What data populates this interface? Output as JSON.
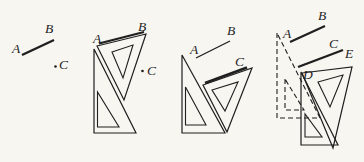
{
  "figure": {
    "background": "#f7f6f1",
    "ink": "#1f1f1f",
    "canvas": {
      "width": 364,
      "height": 162
    },
    "panels": [
      {
        "id": "step-1-given-line-and-point",
        "shapes": [
          {
            "kind": "line",
            "name": "segment-AB",
            "x1": 22,
            "y1": 55,
            "x2": 54,
            "y2": 40,
            "width": 2.4
          },
          {
            "kind": "dot",
            "name": "point-C-dot",
            "cx": 55.5,
            "cy": 66.5,
            "r": 1.3
          }
        ],
        "labels": [
          {
            "name": "label-A",
            "text": "A",
            "x": 12,
            "y": 53
          },
          {
            "name": "label-B",
            "text": "B",
            "x": 45,
            "y": 33
          },
          {
            "name": "label-C",
            "text": "C",
            "x": 59,
            "y": 69
          }
        ]
      },
      {
        "id": "step-2-set-square-edge-on-AB",
        "shapes": [
          {
            "kind": "polygon",
            "name": "fixed-square-outline",
            "points": "94,49 94,133 136,133",
            "width": 1.2
          },
          {
            "kind": "polygon",
            "name": "fixed-square-hole",
            "points": "97.5,92 97.5,127 119,127",
            "width": 1.1
          },
          {
            "kind": "polygon",
            "name": "sliding-square-outline",
            "points": "97,46 146,34 124,100",
            "width": 1.2
          },
          {
            "kind": "polygon",
            "name": "sliding-square-hole",
            "points": "112,52 133,45 123,78",
            "width": 1.1
          },
          {
            "kind": "line",
            "name": "segment-AB",
            "x1": 99,
            "y1": 43.5,
            "x2": 144,
            "y2": 32,
            "width": 2.2
          },
          {
            "kind": "dot",
            "name": "point-C-dot",
            "cx": 142.5,
            "cy": 71,
            "r": 1.3
          }
        ],
        "labels": [
          {
            "name": "label-A",
            "text": "A",
            "x": 93,
            "y": 43
          },
          {
            "name": "label-B",
            "text": "B",
            "x": 138,
            "y": 31
          },
          {
            "name": "label-C",
            "text": "C",
            "x": 147,
            "y": 75
          }
        ]
      },
      {
        "id": "step-3-slide-square-to-C",
        "shapes": [
          {
            "kind": "polygon",
            "name": "fixed-square-outline",
            "points": "182,55 182,133 225,133",
            "width": 1.2
          },
          {
            "kind": "polygon",
            "name": "fixed-square-hole",
            "points": "185.5,87 185.5,125 206,125",
            "width": 1.1
          },
          {
            "kind": "polygon",
            "name": "sliding-square-outline",
            "points": "203,85 252,68 227,132",
            "width": 1.2
          },
          {
            "kind": "polygon",
            "name": "sliding-square-hole",
            "points": "212,90 238,82 225,111",
            "width": 1.1
          },
          {
            "kind": "line",
            "name": "segment-AB",
            "x1": 196,
            "y1": 58,
            "x2": 230,
            "y2": 41,
            "width": 1.3
          },
          {
            "kind": "line",
            "name": "line-through-C",
            "x1": 205,
            "y1": 83,
            "x2": 247,
            "y2": 67.5,
            "width": 2.4
          }
        ],
        "labels": [
          {
            "name": "label-A",
            "text": "A",
            "x": 190,
            "y": 54
          },
          {
            "name": "label-B",
            "text": "B",
            "x": 227,
            "y": 35
          },
          {
            "name": "label-C",
            "text": "C",
            "x": 235,
            "y": 66
          }
        ]
      },
      {
        "id": "step-4-draw-parallel-line-DE",
        "shapes": [
          {
            "kind": "polygon",
            "name": "square-previous-position-outline",
            "points": "277,33 277,118 320,118",
            "width": 1.1,
            "dashed": true
          },
          {
            "kind": "polygon",
            "name": "square-previous-position-hole",
            "points": "285,79 285,110 304,110",
            "width": 1.1,
            "dashed": true
          },
          {
            "kind": "polygon",
            "name": "fixed-square-outline",
            "points": "301,72 301,145 338,145",
            "width": 1.2
          },
          {
            "kind": "polygon",
            "name": "fixed-square-hole",
            "points": "305,114 305,137 322,137",
            "width": 1.1
          },
          {
            "kind": "polygon",
            "name": "sliding-square-outline",
            "points": "302,73 352,67 333,148",
            "width": 1.2
          },
          {
            "kind": "polygon",
            "name": "sliding-square-hole",
            "points": "318,82 343,75 330,107",
            "width": 1.1
          },
          {
            "kind": "line",
            "name": "segment-AB",
            "x1": 290,
            "y1": 42,
            "x2": 325,
            "y2": 26,
            "width": 2.2
          },
          {
            "kind": "line",
            "name": "line-DE-through-C",
            "x1": 298,
            "y1": 67,
            "x2": 343,
            "y2": 50,
            "width": 2.4
          }
        ],
        "labels": [
          {
            "name": "label-A",
            "text": "A",
            "x": 283,
            "y": 38
          },
          {
            "name": "label-B",
            "text": "B",
            "x": 318,
            "y": 20
          },
          {
            "name": "label-C",
            "text": "C",
            "x": 329,
            "y": 48
          },
          {
            "name": "label-D",
            "text": "D",
            "x": 303,
            "y": 79
          },
          {
            "name": "label-E",
            "text": "E",
            "x": 345,
            "y": 58
          }
        ]
      }
    ]
  }
}
